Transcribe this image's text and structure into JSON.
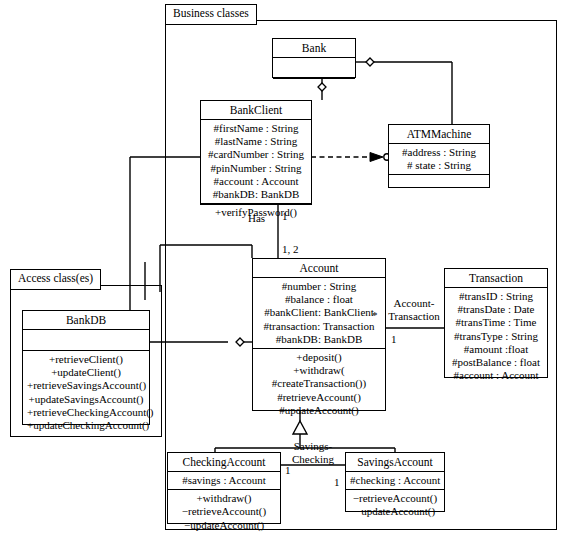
{
  "diagram": {
    "packages": [
      {
        "id": "business",
        "label": "Business classes"
      },
      {
        "id": "access",
        "label": "Access class(es)"
      }
    ],
    "classes": {
      "bank": {
        "name": "Bank",
        "attributes": [],
        "methods": []
      },
      "bankclient": {
        "name": "BankClient",
        "attributes": [
          "#firstName : String",
          "#lastName : String",
          "#cardNumber : String",
          "#pinNumber : String",
          "#account : Account",
          "#bankDB: BankDB"
        ],
        "methods": [
          "+verifyPassword()"
        ]
      },
      "atmmachine": {
        "name": "ATMMachine",
        "attributes": [
          "#address : String",
          "# state : String"
        ],
        "methods": []
      },
      "account": {
        "name": "Account",
        "attributes": [
          "#number : String",
          "#balance : float",
          "#bankClient: BankClient",
          "#transaction: Transaction",
          "#bankDB: BankDB"
        ],
        "methods": [
          "+deposit()",
          "+withdraw(",
          "#createTransaction())",
          "#retrieveAccount()",
          "#updateAccount()"
        ]
      },
      "transaction": {
        "name": "Transaction",
        "attributes": [
          "#transID : String",
          "#transDate : Date",
          "#transTime : Time",
          "#transType : String",
          "#amount :float",
          "#postBalance : float",
          "#account : Account"
        ],
        "methods": []
      },
      "bankdb": {
        "name": "BankDB",
        "attributes": [],
        "methods": [
          "+retrieveClient()",
          "+updateClient()",
          "+retrieveSavingsAccount()",
          "+updateSavingsAccount()",
          "+retrieveCheckingAccount()",
          "+updateCheckingAccount()"
        ]
      },
      "checkingaccount": {
        "name": "CheckingAccount",
        "attributes": [
          "#savings : Account"
        ],
        "methods": [
          "+withdraw()",
          "−retrieveAccount()",
          "−updateAccount()"
        ]
      },
      "savingsaccount": {
        "name": "SavingsAccount",
        "attributes": [
          "#checking : Account"
        ],
        "methods": [
          "−retrieveAccount()",
          "−updateAccount()"
        ]
      }
    },
    "associations": [
      {
        "id": "has",
        "label_line1": "Has",
        "label_line2": ""
      },
      {
        "id": "account-transaction",
        "label_line1": "Account-",
        "label_line2": "Transaction"
      },
      {
        "id": "savings-checking",
        "label_line1": "Savings-",
        "label_line2": "Checking"
      }
    ],
    "multiplicities": {
      "bankclient_account_top": "1",
      "bankclient_account_bottom": "1, 2",
      "account_transaction_star": "*",
      "account_transaction_one": "1",
      "checking_one": "1",
      "savings_one": "1"
    },
    "colors": {
      "stroke": "#000000",
      "fill": "#ffffff"
    }
  }
}
